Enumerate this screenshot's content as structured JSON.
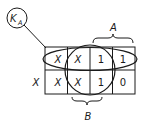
{
  "label_group": {
    "main": "K",
    "subscript": "A"
  },
  "brace_labels": {
    "top": "A",
    "bottom": "B"
  },
  "outside_row_label": "X",
  "grid": {
    "rows": [
      [
        "X",
        "X",
        "1",
        "1"
      ],
      [
        "X",
        "X",
        "1",
        "0"
      ]
    ]
  },
  "colors": {
    "ink": "#1a1a1a",
    "background": "#ffffff"
  }
}
